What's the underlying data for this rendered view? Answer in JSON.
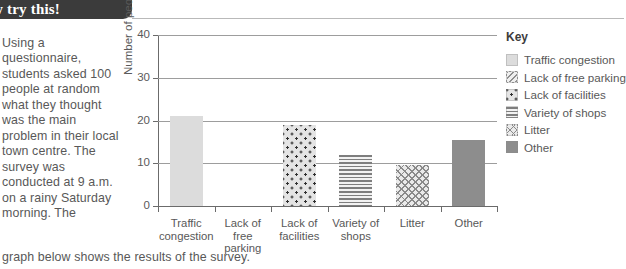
{
  "banner": {
    "label": "w try this!"
  },
  "body": {
    "paragraph": "Using a questionnaire, students asked 100 people at random what they thought was the main problem in their local town centre. The survey was conducted at 9 a.m. on a rainy Saturday morning. The",
    "tail": "graph below shows the results of the survey."
  },
  "legend": {
    "title": "Key",
    "items": [
      {
        "label": "Traffic congestion",
        "pattern": "solid-light"
      },
      {
        "label": "Lack of free parking",
        "pattern": "diagonal-hatch"
      },
      {
        "label": "Lack of facilities",
        "pattern": "dots"
      },
      {
        "label": "Variety of shops",
        "pattern": "horizontal-lines"
      },
      {
        "label": "Litter",
        "pattern": "cross-hatch"
      },
      {
        "label": "Other",
        "pattern": "solid-dark"
      }
    ]
  },
  "chart_data": {
    "type": "bar",
    "title": "",
    "xlabel": "",
    "ylabel": "Number of people",
    "categories": [
      "Traffic congestion",
      "Lack of free parking",
      "Lack of facilities",
      "Variety of shops",
      "Litter",
      "Other"
    ],
    "values": [
      21,
      0,
      19,
      12,
      9.5,
      15.5
    ],
    "ylim": [
      0,
      40
    ],
    "yticks": [
      0,
      10,
      20,
      30,
      40
    ],
    "ytick_labels": [
      "0",
      "10",
      "20",
      "30",
      "40"
    ],
    "grid": true,
    "grid_axis": "y",
    "legend_position": "right",
    "bar_patterns": [
      "solid-light",
      "diagonal-hatch",
      "dots",
      "horizontal-lines",
      "cross-hatch",
      "solid-dark"
    ],
    "colors": {
      "solid-light": "#dcdcdc",
      "solid-dark": "#8d8d8d",
      "axis": "#6b6b6b",
      "gridline": "#9d9d9d",
      "text": "#585858"
    }
  }
}
